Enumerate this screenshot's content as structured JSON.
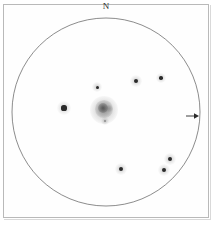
{
  "figure": {
    "orientation_label": "N",
    "background_color": "#ffffff",
    "frame_color": "#b9b9b9",
    "ink_color": "#2a2a2a"
  },
  "field_of_view": {
    "name": "eyepiece-field-circle",
    "center_x": 106,
    "center_y": 112,
    "radius": 94,
    "stroke_color": "#5a5a5a",
    "stroke_width": 0.7
  },
  "deep_sky_object": {
    "name": "central-nebula",
    "type": "diffuse nebula / galaxy",
    "center_x": 104,
    "center_y": 110,
    "halo_radius": 14,
    "core_radius": 5,
    "color": "#6f6f6f"
  },
  "stars": [
    {
      "id": "star-left-bright",
      "x": 64,
      "y": 108,
      "radius": 2.6,
      "halo": 7,
      "magnitude_rank": 1
    },
    {
      "id": "star-upper-center",
      "x": 97,
      "y": 87,
      "radius": 1.5,
      "halo": 5,
      "magnitude_rank": 4
    },
    {
      "id": "star-upper-mid",
      "x": 136,
      "y": 81,
      "radius": 2.0,
      "halo": 6,
      "magnitude_rank": 3
    },
    {
      "id": "star-upper-right",
      "x": 161,
      "y": 78,
      "radius": 1.8,
      "halo": 5,
      "magnitude_rank": 3
    },
    {
      "id": "star-lower-left",
      "x": 121,
      "y": 169,
      "radius": 2.2,
      "halo": 6,
      "magnitude_rank": 2
    },
    {
      "id": "star-lower-right-a",
      "x": 170,
      "y": 159,
      "radius": 2.0,
      "halo": 6,
      "magnitude_rank": 2
    },
    {
      "id": "star-lower-right-b",
      "x": 164,
      "y": 170,
      "radius": 2.2,
      "halo": 6,
      "magnitude_rank": 2
    },
    {
      "id": "star-below-nebula",
      "x": 105,
      "y": 121,
      "radius": 1.0,
      "halo": 4,
      "magnitude_rank": 6
    }
  ],
  "arrow_marker": {
    "name": "east-direction-arrow",
    "x": 186,
    "y": 112,
    "length": 12,
    "direction": "right",
    "color": "#2a2a2a"
  }
}
